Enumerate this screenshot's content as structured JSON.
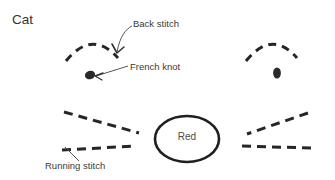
{
  "figure": {
    "title": "Cat",
    "background_color": "#ffffff",
    "ink_color": "#262626",
    "text_color": "#3a3a3a",
    "width": 335,
    "height": 180
  },
  "annotations": {
    "back_stitch": {
      "label": "Back stitch",
      "x": 133,
      "y": 18,
      "leader": "curved arrow pointing down-left to left ear arc"
    },
    "french_knot": {
      "label": "French knot",
      "x": 130,
      "y": 61,
      "leader": "straight arrow pointing down-left to left eye dot"
    },
    "running_stitch": {
      "label": "Running stitch",
      "x": 45,
      "y": 160,
      "leader": "short diagonal line up-right to lower whisker"
    }
  },
  "callout": {
    "shape": "ellipse",
    "label": "Red",
    "cx": 187,
    "cy": 139,
    "rx": 32,
    "ry": 23
  },
  "motif": {
    "name": "cat-face-embroidery-pattern",
    "left_ear": {
      "type": "dashed-arc",
      "start": [
        66,
        60
      ],
      "peak": [
        92,
        37
      ],
      "end": [
        118,
        58
      ]
    },
    "right_ear": {
      "type": "dashed-arc",
      "start": [
        246,
        60
      ],
      "peak": [
        272,
        37
      ],
      "end": [
        297,
        58
      ]
    },
    "left_eye": {
      "type": "filled-ellipse",
      "cx": 90,
      "cy": 75,
      "rx": 5,
      "ry": 4
    },
    "right_eye": {
      "type": "filled-ellipse",
      "cx": 277,
      "cy": 73,
      "rx": 4,
      "ry": 5.5
    },
    "left_whisker_upper": {
      "type": "dashed-line",
      "start": [
        64,
        112
      ],
      "end": [
        139,
        133
      ]
    },
    "left_whisker_lower": {
      "type": "dashed-line",
      "start": [
        62,
        150
      ],
      "end": [
        136,
        146
      ]
    },
    "right_whisker_upper": {
      "type": "dashed-line",
      "start": [
        308,
        113
      ],
      "end": [
        247,
        134
      ]
    },
    "right_whisker_lower": {
      "type": "dashed-line",
      "start": [
        311,
        148
      ],
      "end": [
        240,
        146
      ]
    }
  }
}
